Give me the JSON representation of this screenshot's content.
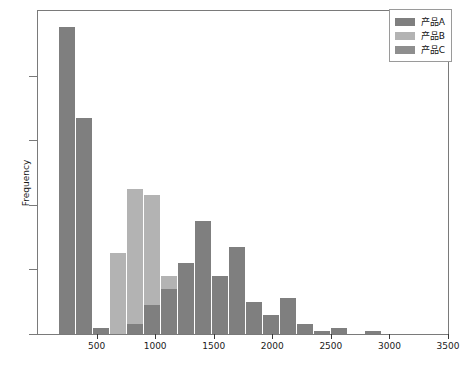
{
  "chart_data": {
    "type": "bar",
    "title": "",
    "subtitle": "",
    "xlabel": "",
    "ylabel": "Frequency",
    "xlim": [
      0,
      3500
    ],
    "ylim": [
      0,
      100
    ],
    "grid": false,
    "stacked": true,
    "legend_position": "top-right",
    "bin_width": 145,
    "xticks": [
      500,
      1000,
      1500,
      2000,
      2500,
      3000,
      3500
    ],
    "xtick_labels": [
      "500",
      "1000",
      "1500",
      "2000",
      "2500",
      "3000",
      "3500"
    ],
    "yticks": [
      0,
      20,
      40,
      60,
      80
    ],
    "ytick_labels": [
      "0",
      "20",
      "40",
      "60",
      "80"
    ],
    "legend": [
      {
        "name": "产品A",
        "color": "#7f7f7f"
      },
      {
        "name": "产品B",
        "color": "#b3b3b3"
      },
      {
        "name": "产品C",
        "color": "#8e8e8e"
      }
    ],
    "bin_centers": [
      255,
      400,
      545,
      690,
      835,
      980,
      1125,
      1270,
      1415,
      1560,
      1705,
      1850,
      1995,
      2140,
      2285,
      2430,
      2575,
      2720,
      2865,
      3010,
      3155,
      3300
    ],
    "bin_starts": [
      183,
      328,
      473,
      618,
      763,
      908,
      1053,
      1198,
      1343,
      1488,
      1633,
      1778,
      1923,
      2068,
      2213,
      2358,
      2503,
      2648,
      2793,
      2938,
      3083,
      3228
    ],
    "series": [
      {
        "name": "产品A",
        "color": "#7f7f7f",
        "values": [
          95,
          67,
          2,
          0,
          3,
          9,
          14,
          22,
          35,
          18,
          27,
          10,
          6,
          11,
          3,
          1,
          2,
          0,
          1,
          0,
          0,
          0
        ]
      },
      {
        "name": "产品B",
        "color": "#b3b3b3",
        "values": [
          0,
          0,
          0,
          25,
          42,
          34,
          4,
          0,
          0,
          0,
          0,
          0,
          0,
          0,
          0,
          0,
          0,
          0,
          0,
          0,
          0,
          0
        ]
      },
      {
        "name": "产品C",
        "color": "#8e8e8e",
        "values": [
          0,
          0,
          0,
          0,
          0,
          0,
          0,
          0,
          0,
          0,
          0,
          0,
          0,
          0,
          0,
          0,
          0,
          0,
          0,
          0,
          0,
          0
        ]
      }
    ],
    "totals": [
      95,
      67,
      2,
      25,
      45,
      43,
      18,
      22,
      35,
      18,
      27,
      10,
      6,
      11,
      3,
      1,
      2,
      0,
      1,
      0,
      0,
      0
    ]
  }
}
